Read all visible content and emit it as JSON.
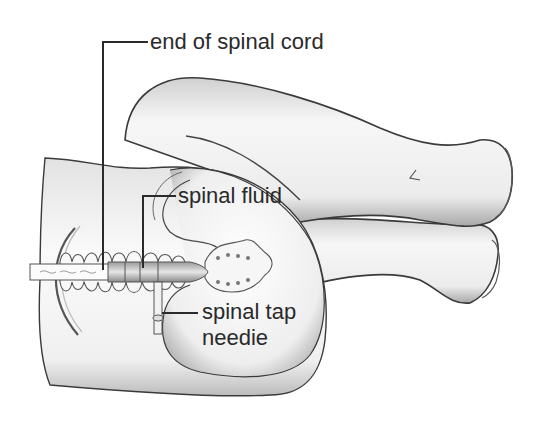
{
  "diagram": {
    "labels": {
      "end_of_spinal_cord": "end of spinal cord",
      "spinal_fluid": "spinal fluid",
      "spinal_tap_needle_line1": "spinal tap",
      "spinal_tap_needle_line2": "needie"
    },
    "colors": {
      "background": "#ffffff",
      "outline": "#3a3a3a",
      "skin_light": "#f4f4f4",
      "skin_shade": "#b8b8b8",
      "leader_line": "#2a2a2a",
      "text": "#2a2a2a"
    }
  }
}
